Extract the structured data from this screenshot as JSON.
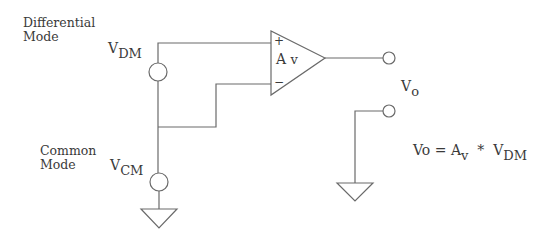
{
  "labels": {
    "differential_line1": "Differential",
    "differential_line2": "Mode",
    "common_line1": "Common",
    "common_line2": "Mode"
  },
  "sources": {
    "vdm": {
      "main": "V",
      "sub": "DM"
    },
    "vcm": {
      "main": "V",
      "sub": "CM"
    }
  },
  "opamp": {
    "plus": "+",
    "minus": "−",
    "gain_main": "A",
    "gain_sub": "v"
  },
  "output": {
    "main": "V",
    "sub": "o"
  },
  "equation": {
    "lhs": "Vo =",
    "gain_main": "A",
    "gain_sub": "v",
    "op": "*",
    "rhs_main": "V",
    "rhs_sub": "DM"
  },
  "colors": {
    "stroke": "#6a6a6a",
    "text": "#3a3a3a",
    "background": "#ffffff"
  }
}
